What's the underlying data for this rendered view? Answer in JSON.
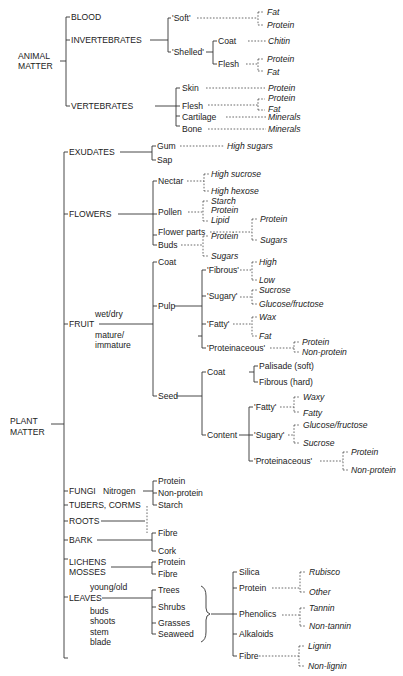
{
  "diagram": {
    "type": "tree",
    "roots": {
      "animal": "ANIMAL",
      "animal2": "MATTER",
      "plant": "PLANT",
      "plant2": "MATTER"
    },
    "animal": {
      "blood": "BLOOD",
      "invertebrates": "INVERTEBRATES",
      "vertebrates": "VERTEBRATES",
      "soft": "'Soft'",
      "shelled": "'Shelled'",
      "soft_fat": "Fat",
      "soft_protein": "Protein",
      "coat": "Coat",
      "chitin": "Chitin",
      "flesh": "Flesh",
      "flesh_protein": "Protein",
      "flesh_fat": "Fat",
      "skin": "Skin",
      "skin_protein": "Protein",
      "v_flesh": "Flesh",
      "v_flesh_protein": "Protein",
      "v_flesh_fat": "Fat",
      "cartilage": "Cartilage",
      "cartilage_minerals": "Minerals",
      "bone": "Bone",
      "bone_minerals": "Minerals"
    },
    "exudates": {
      "label": "EXUDATES",
      "gum": "Gum",
      "gum_val": "High sugars",
      "sap": "Sap"
    },
    "flowers": {
      "label": "FLOWERS",
      "nectar": "Nectar",
      "nectar_a": "High sucrose",
      "nectar_b": "High hexose",
      "pollen": "Pollen",
      "pollen_a": "Starch",
      "pollen_b": "Protein",
      "pollen_c": "Lipid",
      "parts": "Flower parts",
      "parts_a": "Protein",
      "parts_b": "Sugars",
      "buds": "Buds",
      "buds_a": "Protein",
      "buds_b": "Sugars"
    },
    "fruit": {
      "label": "FRUIT",
      "note1": "wet/dry",
      "note2": "mature/",
      "note3": "immature",
      "coat": "Coat",
      "pulp": "Pulp",
      "fibrous": "'Fibrous'",
      "fibrous_a": "High",
      "fibrous_b": "Low",
      "sugary": "'Sugary'",
      "sugary_a": "Sucrose",
      "sugary_b": "Glucose/fructose",
      "fatty": "'Fatty'",
      "fatty_a": "Wax",
      "fatty_b": "Fat",
      "prot": "'Proteinaceous'",
      "prot_a": "Protein",
      "prot_b": "Non-protein",
      "seed": "Seed",
      "seed_coat": "Coat",
      "palisade": "Palisade (soft)",
      "fibrous_hard": "Fibrous (hard)",
      "content": "Content",
      "s_fatty": "'Fatty'",
      "s_fatty_a": "Waxy",
      "s_fatty_b": "Fatty",
      "s_sugary": "'Sugary'",
      "s_sugary_a": "Glucose/fructose",
      "s_sugary_b": "Sucrose",
      "s_prot": "'Proteinaceous'",
      "s_prot_a": "Protein",
      "s_prot_b": "Non-protein"
    },
    "lower": {
      "fungi": "FUNGI",
      "nitrogen": "Nitrogen",
      "tubers": "TUBERS, CORMS",
      "roots": "ROOTS",
      "bark": "BARK",
      "lichens": "LICHENS",
      "mosses": "MOSSES",
      "n_protein": "Protein",
      "n_nonprotein": "Non-protein",
      "starch": "Starch",
      "fibre": "Fibre",
      "cork": "Cork",
      "lm_protein": "Protein",
      "lm_fibre": "Fibre"
    },
    "leaves": {
      "label": "LEAVES",
      "young": "young/old",
      "buds": "buds",
      "shoots": "shoots",
      "stem": "stem",
      "blade": "blade",
      "trees": "Trees",
      "shrubs": "Shrubs",
      "grasses": "Grasses",
      "seaweed": "Seaweed",
      "silica": "Silica",
      "protein": "Protein",
      "rubisco": "Rubisco",
      "other": "Other",
      "phenolics": "Phenolics",
      "tannin": "Tannin",
      "nontannin": "Non-tannin",
      "alkaloids": "Alkaloids",
      "fibre": "Fibre",
      "lignin": "Lignin",
      "nonlignin": "Non-lignin"
    }
  }
}
